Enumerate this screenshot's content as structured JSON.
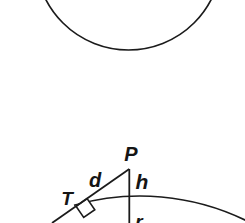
{
  "figure": {
    "background": "#ffffff",
    "stroke": "#1b1b1b",
    "upper_shape": "bottom arc of a circle (cut off by top edge of view)",
    "lower_shape": "circle with external point P, tangent line P-T, secant line through P and center, right-angle marker at tangent point",
    "labels": {
      "external_point": "P",
      "tangent_segment": "d",
      "height_segment": "h",
      "tangent_point": "T",
      "radius_segment": "r"
    }
  }
}
